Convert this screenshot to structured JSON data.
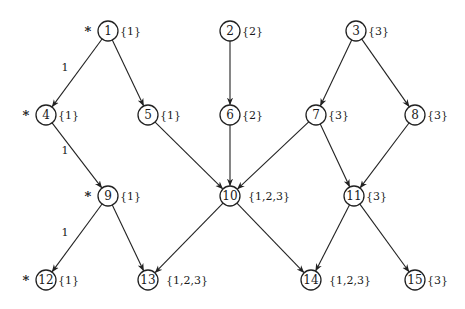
{
  "diagram": {
    "type": "directed-graph",
    "node_radius": 10,
    "colors": {
      "stroke": "#222222",
      "background": "#ffffff",
      "text": "#1a1a1a"
    },
    "nodes": [
      {
        "id": "1",
        "x": 108,
        "y": 31,
        "set": "{1}",
        "starred": true
      },
      {
        "id": "2",
        "x": 230,
        "y": 31,
        "set": "{2}",
        "starred": false
      },
      {
        "id": "3",
        "x": 356,
        "y": 31,
        "set": "{3}",
        "starred": false
      },
      {
        "id": "4",
        "x": 46,
        "y": 115,
        "set": "{1}",
        "starred": true
      },
      {
        "id": "5",
        "x": 148,
        "y": 115,
        "set": "{1}",
        "starred": false
      },
      {
        "id": "6",
        "x": 230,
        "y": 115,
        "set": "{2}",
        "starred": false
      },
      {
        "id": "7",
        "x": 316,
        "y": 115,
        "set": "{3}",
        "starred": false
      },
      {
        "id": "8",
        "x": 415,
        "y": 115,
        "set": "{3}",
        "starred": false
      },
      {
        "id": "9",
        "x": 108,
        "y": 196,
        "set": "{1}",
        "starred": true
      },
      {
        "id": "10",
        "x": 230,
        "y": 196,
        "set": "{1,2,3}",
        "starred": false
      },
      {
        "id": "11",
        "x": 354,
        "y": 196,
        "set": "{3}",
        "starred": false
      },
      {
        "id": "12",
        "x": 46,
        "y": 280,
        "set": "{1}",
        "starred": true
      },
      {
        "id": "13",
        "x": 148,
        "y": 280,
        "set": "{1,2,3}",
        "starred": false
      },
      {
        "id": "14",
        "x": 311,
        "y": 280,
        "set": "{1,2,3}",
        "starred": false
      },
      {
        "id": "15",
        "x": 415,
        "y": 280,
        "set": "{3}",
        "starred": false
      }
    ],
    "edges": [
      {
        "from": "1",
        "to": "4",
        "label": "1"
      },
      {
        "from": "1",
        "to": "5",
        "label": ""
      },
      {
        "from": "2",
        "to": "6",
        "label": ""
      },
      {
        "from": "3",
        "to": "7",
        "label": ""
      },
      {
        "from": "3",
        "to": "8",
        "label": ""
      },
      {
        "from": "4",
        "to": "9",
        "label": "1"
      },
      {
        "from": "5",
        "to": "10",
        "label": ""
      },
      {
        "from": "6",
        "to": "10",
        "label": ""
      },
      {
        "from": "7",
        "to": "10",
        "label": ""
      },
      {
        "from": "7",
        "to": "11",
        "label": ""
      },
      {
        "from": "8",
        "to": "11",
        "label": ""
      },
      {
        "from": "9",
        "to": "12",
        "label": "1"
      },
      {
        "from": "9",
        "to": "13",
        "label": ""
      },
      {
        "from": "10",
        "to": "13",
        "label": ""
      },
      {
        "from": "10",
        "to": "14",
        "label": ""
      },
      {
        "from": "11",
        "to": "14",
        "label": ""
      },
      {
        "from": "11",
        "to": "15",
        "label": ""
      }
    ],
    "star_symbol": "*"
  }
}
